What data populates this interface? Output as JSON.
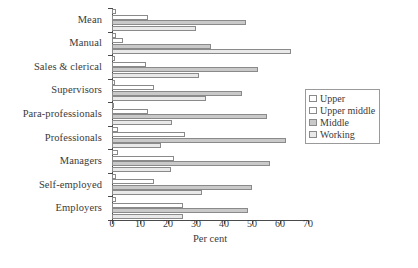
{
  "chart_data": {
    "type": "bar",
    "orientation": "horizontal",
    "title": "",
    "xlabel": "Per cent",
    "ylabel": "",
    "xlim": [
      0,
      70
    ],
    "xticks": [
      0,
      10,
      20,
      30,
      40,
      50,
      60,
      70
    ],
    "grid": false,
    "legend_position": "right",
    "categories": [
      "Mean",
      "Manual",
      "Sales & clerical",
      "Supervisors",
      "Para-professionals",
      "Professionals",
      "Managers",
      "Self-employed",
      "Employers"
    ],
    "series": [
      {
        "name": "Upper",
        "color": "#ffffff",
        "values": [
          1.5,
          1.5,
          1.0,
          1.0,
          0.5,
          2.0,
          2.0,
          1.5,
          1.5
        ]
      },
      {
        "name": "Upper middle",
        "color": "#ffffff",
        "values": [
          13.0,
          4.0,
          12.0,
          15.0,
          13.0,
          26.0,
          22.0,
          15.0,
          25.5
        ]
      },
      {
        "name": "Middle",
        "color": "#c9c9c9",
        "values": [
          48.0,
          35.5,
          52.0,
          46.5,
          55.5,
          62.0,
          56.5,
          50.0,
          48.5
        ]
      },
      {
        "name": "Working",
        "color": "#e9e9e9",
        "values": [
          30.0,
          64.0,
          31.0,
          33.5,
          21.5,
          17.5,
          21.0,
          32.0,
          25.5
        ]
      }
    ]
  },
  "legend": {
    "items": [
      {
        "label": "Upper"
      },
      {
        "label": "Upper middle"
      },
      {
        "label": "Middle"
      },
      {
        "label": "Working"
      }
    ]
  }
}
